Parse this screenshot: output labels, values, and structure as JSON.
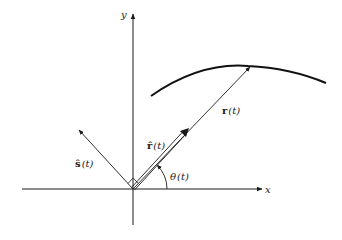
{
  "diagram": {
    "axes": {
      "x_label": "x",
      "y_label": "y"
    },
    "vectors": {
      "r": {
        "symbol": "r",
        "arg": "(t)"
      },
      "r_hat": {
        "symbol": "r̂",
        "arg": "(t)"
      },
      "s_hat": {
        "symbol": "ŝ",
        "arg": "(t)"
      }
    },
    "angle": {
      "symbol": "θ",
      "arg": "(t)"
    },
    "colors": {
      "ink": "#1a1a1a",
      "background": "#ffffff"
    }
  }
}
